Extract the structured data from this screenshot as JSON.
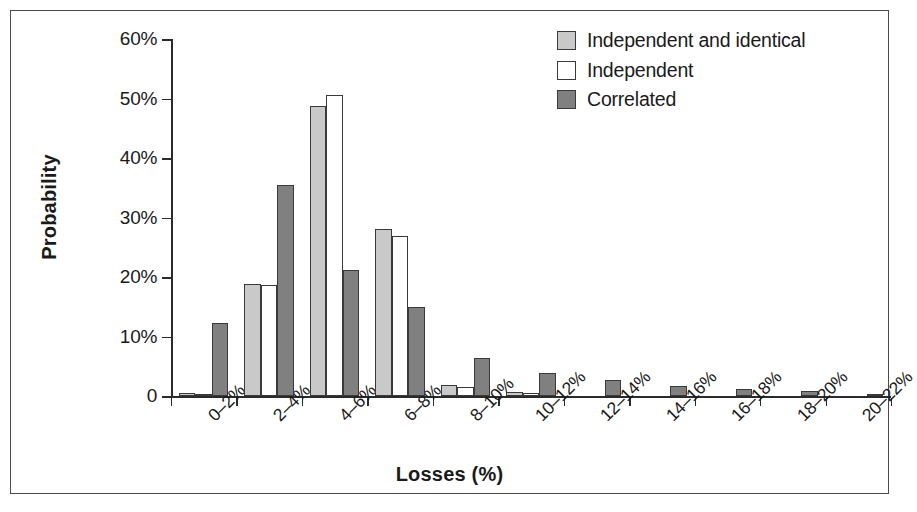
{
  "chart_data": {
    "type": "bar",
    "title": "",
    "xlabel": "Losses (%)",
    "ylabel": "Probability",
    "categories": [
      "0–2%",
      "2–4%",
      "4–6%",
      "6–8%",
      "8–10%",
      "10–12%",
      "12–14%",
      "14–16%",
      "16–18%",
      "18–20%",
      "20–22%"
    ],
    "ylim": [
      0,
      60
    ],
    "ytick_values": [
      0,
      10,
      20,
      30,
      40,
      50,
      60
    ],
    "ytick_labels": [
      "0",
      "10%",
      "20%",
      "30%",
      "40%",
      "50%",
      "60%"
    ],
    "grid": false,
    "legend_position": "top-right",
    "series": [
      {
        "name": "Independent and identical",
        "color": "#c9c9c9",
        "values": [
          0.6,
          18.9,
          48.8,
          28.2,
          1.9,
          0.7,
          0.0,
          0.0,
          0.0,
          0.0,
          0.0
        ]
      },
      {
        "name": "Independent",
        "color": "#ffffff",
        "values": [
          0.4,
          18.8,
          50.6,
          26.9,
          1.5,
          0.5,
          0.0,
          0.0,
          0.0,
          0.0,
          0.0
        ]
      },
      {
        "name": "Correlated",
        "color": "#808080",
        "values": [
          12.4,
          35.5,
          21.3,
          15.1,
          6.5,
          4.0,
          2.7,
          1.7,
          1.3,
          0.9,
          0.4
        ]
      }
    ]
  },
  "legend": {
    "items": [
      {
        "label": "Independent and identical",
        "swatch": "s0"
      },
      {
        "label": "Independent",
        "swatch": "s1"
      },
      {
        "label": "Correlated",
        "swatch": "s2"
      }
    ]
  },
  "axes": {
    "y_title": "Probability",
    "x_title": "Losses (%)"
  }
}
